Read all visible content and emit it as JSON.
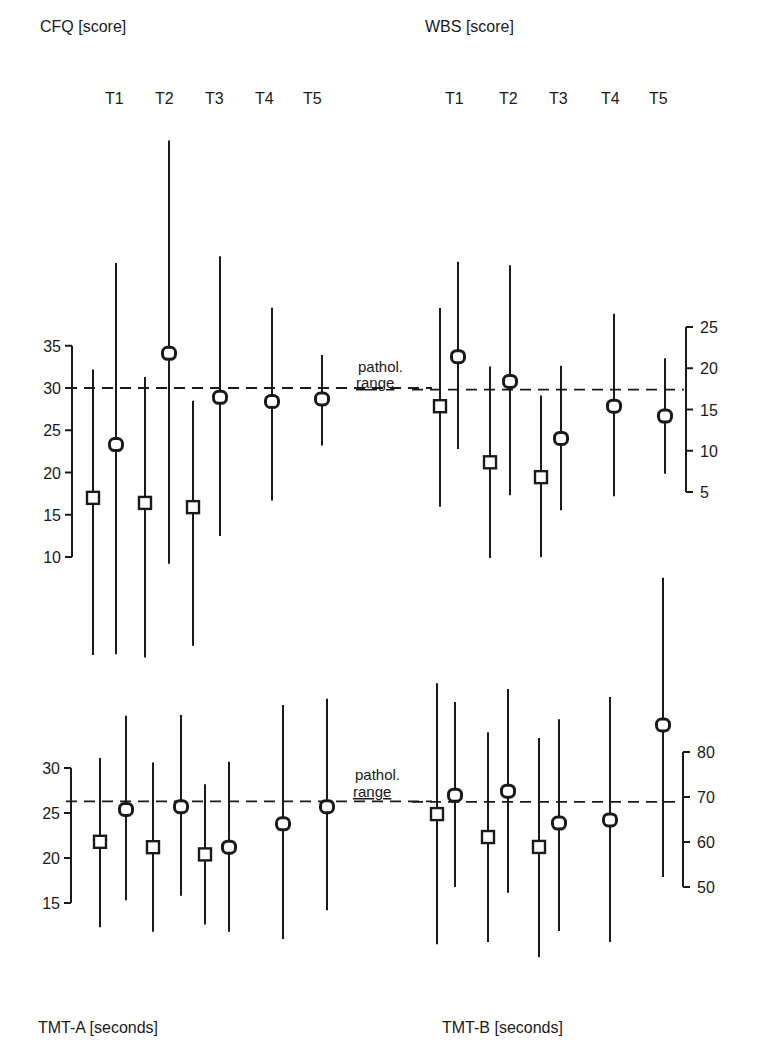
{
  "chart_data": [
    {
      "type": "scatter",
      "title": "CFQ [score]",
      "panel": "top-left",
      "xlabel": "",
      "ylabel": "CFQ [score]",
      "categories": [
        "T1",
        "T2",
        "T3",
        "T4",
        "T5"
      ],
      "yticks": [
        35,
        30,
        25,
        20,
        15,
        10
      ],
      "axis_side": "left",
      "ylim": [
        10,
        35
      ],
      "reference_line": {
        "value": 30,
        "style": "dashed",
        "label": "pathol. range"
      },
      "series": [
        {
          "name": "square-marker group",
          "marker": "square",
          "points": [
            {
              "t": "T1",
              "value": 17.0,
              "upper": 32.2,
              "lower": -1.6
            },
            {
              "t": "T2",
              "value": 16.4,
              "upper": 31.3,
              "lower": -1.9
            },
            {
              "t": "T3",
              "value": 15.9,
              "upper": 28.5,
              "lower": -0.5
            }
          ]
        },
        {
          "name": "circle-marker group",
          "marker": "circle",
          "points": [
            {
              "t": "T1",
              "value": 23.3,
              "upper": 44.8,
              "lower": -1.5
            },
            {
              "t": "T2",
              "value": 34.1,
              "upper": 59.3,
              "lower": 9.2
            },
            {
              "t": "T3",
              "value": 28.9,
              "upper": 45.6,
              "lower": 12.5
            },
            {
              "t": "T4",
              "value": 28.4,
              "upper": 39.5,
              "lower": 16.7
            },
            {
              "t": "T5",
              "value": 28.7,
              "upper": 33.9,
              "lower": 23.2
            }
          ]
        }
      ]
    },
    {
      "type": "scatter",
      "title": "WBS [score]",
      "panel": "top-right",
      "ylabel": "WBS [score]",
      "categories": [
        "T1",
        "T2",
        "T3",
        "T4",
        "T5"
      ],
      "yticks": [
        25,
        20,
        15,
        10,
        5
      ],
      "axis_side": "right",
      "ylim": [
        5,
        25
      ],
      "reference_line": {
        "value": 17.4,
        "style": "dashed",
        "label": "pathol. range"
      },
      "series": [
        {
          "name": "square-marker group",
          "marker": "square",
          "points": [
            {
              "t": "T1",
              "value": 15.4,
              "upper": 27.3,
              "lower": 3.2
            },
            {
              "t": "T2",
              "value": 8.6,
              "upper": 20.2,
              "lower": -3.0
            },
            {
              "t": "T3",
              "value": 6.8,
              "upper": 16.7,
              "lower": -2.9
            }
          ]
        },
        {
          "name": "circle-marker group",
          "marker": "circle",
          "points": [
            {
              "t": "T1",
              "value": 21.4,
              "upper": 32.9,
              "lower": 10.2
            },
            {
              "t": "T2",
              "value": 18.4,
              "upper": 32.5,
              "lower": 4.6
            },
            {
              "t": "T3",
              "value": 11.5,
              "upper": 20.3,
              "lower": 2.8
            },
            {
              "t": "T4",
              "value": 15.4,
              "upper": 26.6,
              "lower": 4.5
            },
            {
              "t": "T5",
              "value": 14.2,
              "upper": 21.2,
              "lower": 7.2
            }
          ]
        }
      ]
    },
    {
      "type": "scatter",
      "title": "TMT-A [seconds]",
      "panel": "bottom-left",
      "ylabel": "TMT-A [seconds]",
      "categories": [
        "T1",
        "T2",
        "T3",
        "T4",
        "T5"
      ],
      "yticks": [
        30,
        25,
        20,
        15
      ],
      "axis_side": "left",
      "ylim": [
        15,
        30
      ],
      "reference_line": {
        "value": 26.3,
        "style": "dashed",
        "label": "pathol. range"
      },
      "series": [
        {
          "name": "square-marker group",
          "marker": "square",
          "points": [
            {
              "t": "T1",
              "value": 21.8,
              "upper": 31.1,
              "lower": 12.3
            },
            {
              "t": "T2",
              "value": 21.2,
              "upper": 30.6,
              "lower": 11.8
            },
            {
              "t": "T3",
              "value": 20.4,
              "upper": 28.2,
              "lower": 12.6
            }
          ]
        },
        {
          "name": "circle-marker group",
          "marker": "circle",
          "points": [
            {
              "t": "T1",
              "value": 25.4,
              "upper": 35.8,
              "lower": 15.3
            },
            {
              "t": "T2",
              "value": 25.7,
              "upper": 35.9,
              "lower": 15.8
            },
            {
              "t": "T3",
              "value": 21.2,
              "upper": 30.7,
              "lower": 11.8
            },
            {
              "t": "T4",
              "value": 23.8,
              "upper": 37.0,
              "lower": 11.0
            },
            {
              "t": "T5",
              "value": 25.7,
              "upper": 37.7,
              "lower": 14.2
            }
          ]
        }
      ]
    },
    {
      "type": "scatter",
      "title": "TMT-B [seconds]",
      "panel": "bottom-right",
      "ylabel": "TMT-B [seconds]",
      "categories": [
        "T1",
        "T2",
        "T3",
        "T4",
        "T5"
      ],
      "yticks": [
        80,
        70,
        60,
        50
      ],
      "axis_side": "right",
      "ylim": [
        50,
        80
      ],
      "reference_line": {
        "value": 68.9,
        "style": "dashed",
        "label": "pathol. range"
      },
      "series": [
        {
          "name": "square-marker group",
          "marker": "square",
          "points": [
            {
              "t": "T1",
              "value": 66.2,
              "upper": 95.3,
              "lower": 37.3
            },
            {
              "t": "T2",
              "value": 61.1,
              "upper": 84.4,
              "lower": 37.8
            },
            {
              "t": "T3",
              "value": 58.9,
              "upper": 83.1,
              "lower": 34.4
            }
          ]
        },
        {
          "name": "circle-marker group",
          "marker": "circle",
          "points": [
            {
              "t": "T1",
              "value": 70.4,
              "upper": 91.1,
              "lower": 50.0
            },
            {
              "t": "T2",
              "value": 71.3,
              "upper": 94.0,
              "lower": 48.7
            },
            {
              "t": "T3",
              "value": 64.2,
              "upper": 87.3,
              "lower": 40.2
            },
            {
              "t": "T4",
              "value": 64.9,
              "upper": 92.2,
              "lower": 37.8
            },
            {
              "t": "T5",
              "value": 86.0,
              "upper": 118.7,
              "lower": 52.2
            }
          ]
        }
      ]
    }
  ],
  "labels": {
    "cfq": "CFQ [score]",
    "wbs": "WBS [score]",
    "tmta": "TMT-A [seconds]",
    "tmtb": "TMT-B [seconds]",
    "pathol_line1": "pathol.",
    "pathol_line2": "range",
    "t_labels": [
      "T1",
      "T2",
      "T3",
      "T4",
      "T5"
    ]
  },
  "colors": {
    "ink": "#1a1a1a",
    "background": "#ffffff"
  }
}
